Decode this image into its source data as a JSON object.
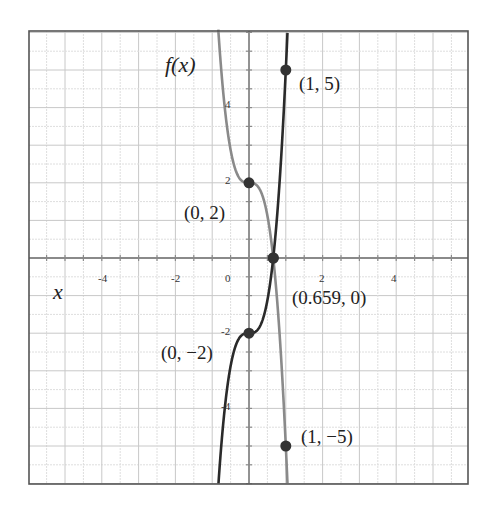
{
  "chart_data": {
    "type": "line",
    "title": "",
    "xlabel": "x",
    "ylabel": "f(x)",
    "xlim": [
      -6,
      6
    ],
    "ylim": [
      -6,
      6
    ],
    "grid": true,
    "x_ticks": [
      "-4",
      "-2",
      "0",
      "2",
      "4"
    ],
    "y_ticks": [
      "4",
      "2",
      "-2",
      "-4"
    ],
    "series": [
      {
        "name": "gray curve",
        "color": "#8a8a8a",
        "formula": "2 - 7x^3",
        "points": [
          {
            "x": 0,
            "y": 2,
            "label": "(0, 2)"
          },
          {
            "x": 0.659,
            "y": 0,
            "label": "(0.659, 0)"
          },
          {
            "x": 1,
            "y": -5,
            "label": "(1, -5)"
          }
        ]
      },
      {
        "name": "dark curve",
        "color": "#2a2a2a",
        "formula": "-2 + 7x^3",
        "points": [
          {
            "x": 0,
            "y": -2,
            "label": "(0, -2)"
          },
          {
            "x": 0.659,
            "y": 0,
            "label": "(0.659, 0)"
          },
          {
            "x": 1,
            "y": 5,
            "label": "(1, 5)"
          }
        ]
      }
    ],
    "annotations": [
      "(1, 5)",
      "(0, 2)",
      "(0.659, 0)",
      "(0, -2)",
      "(1, -5)"
    ]
  },
  "labels": {
    "y_axis": "f(x)",
    "x_axis": "x",
    "p1": "(1, 5)",
    "p2": "(0, 2)",
    "p3": "(0.659, 0)",
    "p4": "(0, −2)",
    "p5": "(1, −5)"
  },
  "ticks": {
    "xm4": "-4",
    "xm2": "-2",
    "x0": "0",
    "x2": "2",
    "x4": "4",
    "y4": "4",
    "y2": "2",
    "ym2": "-2",
    "ym4": "-4"
  }
}
